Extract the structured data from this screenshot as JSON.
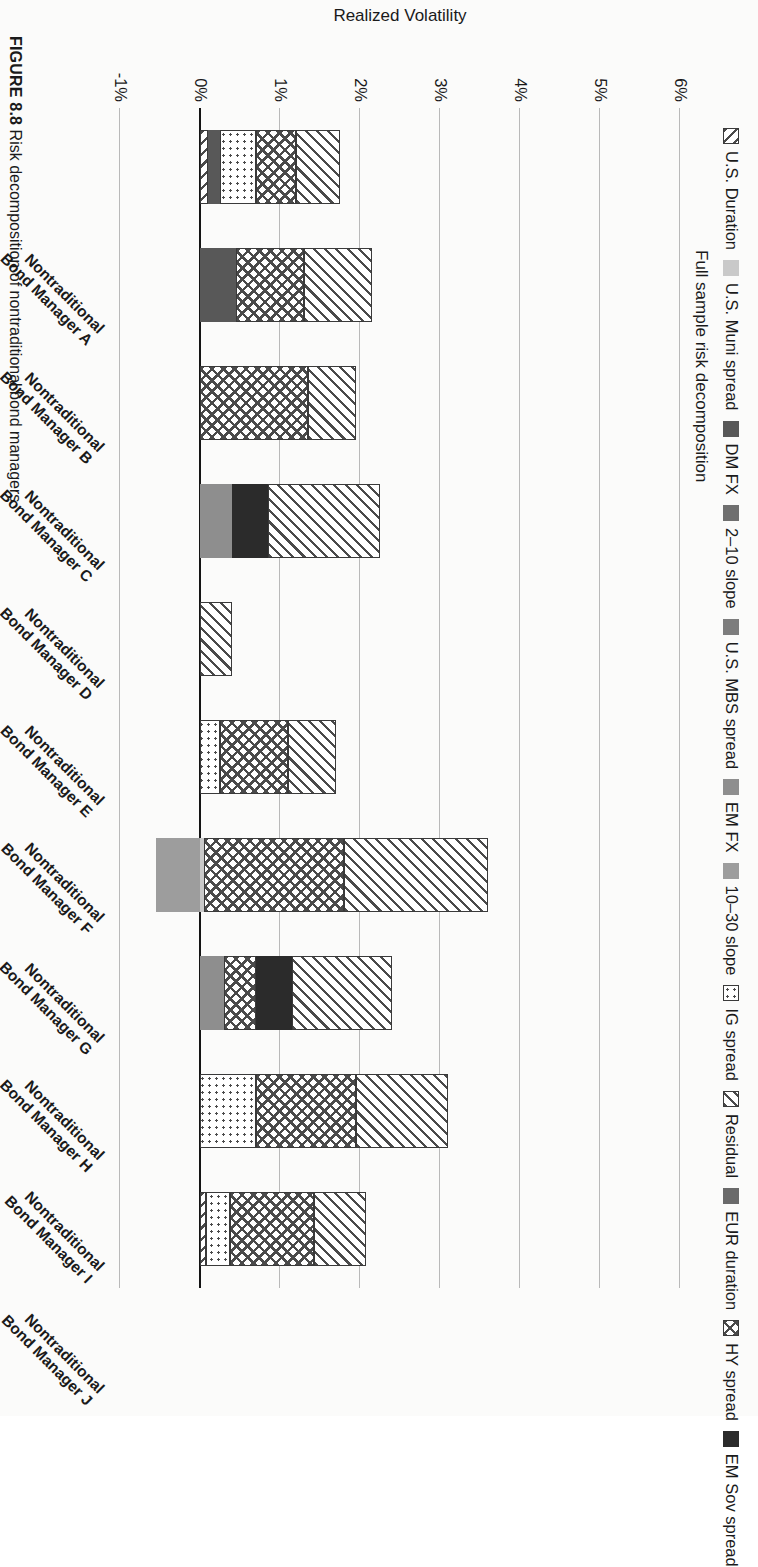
{
  "chart_title": "Full sample risk decomposition",
  "caption": {
    "label": "FIGURE 8.8",
    "text": "Risk decomposition of nontraditional bond managers"
  },
  "axes": {
    "ylabel": "Realized Volatility",
    "yticks": [
      "6%",
      "5%",
      "4%",
      "3%",
      "2%",
      "1%",
      "0%",
      "-1%"
    ],
    "ymin": -1,
    "ymax": 6,
    "gridlines": true
  },
  "legend": {
    "position": "top",
    "columns": 4,
    "rows": 3,
    "items": [
      {
        "label": "U.S. Duration",
        "pattern": "diag-up-thin",
        "color": "#ffffff",
        "icon": "swatch-diag-up"
      },
      {
        "label": "U.S. Muni spread",
        "pattern": "solid",
        "color": "#c9c9c9",
        "icon": "swatch-solid-lightgray"
      },
      {
        "label": "DM FX",
        "pattern": "solid",
        "color": "#585858",
        "icon": "swatch-solid-darkgray"
      },
      {
        "label": "2–10 slope",
        "pattern": "solid",
        "color": "#6f6f6f",
        "icon": "swatch-solid-gray"
      },
      {
        "label": "U.S. MBS spread",
        "pattern": "solid",
        "color": "#7d7d7d",
        "icon": "swatch-solid-gray2"
      },
      {
        "label": "EM FX",
        "pattern": "solid",
        "color": "#8e8e8e",
        "icon": "swatch-solid-midgray"
      },
      {
        "label": "10–30 slope",
        "pattern": "solid",
        "color": "#9d9d9d",
        "icon": "swatch-solid-gray3"
      },
      {
        "label": "IG spread",
        "pattern": "dots",
        "color": "#ffffff",
        "icon": "swatch-dotted"
      },
      {
        "label": "Residual",
        "pattern": "diag-down-thin",
        "color": "#ffffff",
        "icon": "swatch-diag-down"
      },
      {
        "label": "EUR duration",
        "pattern": "solid",
        "color": "#6a6a6a",
        "icon": "swatch-solid-gray4"
      },
      {
        "label": "HY spread",
        "pattern": "crosshatch",
        "color": "#ffffff",
        "icon": "swatch-crosshatch"
      },
      {
        "label": "EM Sov spread",
        "pattern": "solid",
        "color": "#2b2b2b",
        "icon": "swatch-solid-black"
      }
    ]
  },
  "chart_data": {
    "type": "bar",
    "subtype": "stacked-bar",
    "title": "Full sample risk decomposition",
    "xlabel": "",
    "ylabel": "Realized Volatility",
    "ylim": [
      -1,
      6
    ],
    "yticks": [
      -1,
      0,
      1,
      2,
      3,
      4,
      5,
      6
    ],
    "ytick_labels": [
      "-1%",
      "0%",
      "1%",
      "2%",
      "3%",
      "4%",
      "5%",
      "6%"
    ],
    "grid": true,
    "legend_position": "top",
    "categories": [
      "Nontraditional Bond Manager A",
      "Nontraditional Bond Manager B",
      "Nontraditional Bond Manager C",
      "Nontraditional Bond Manager D",
      "Nontraditional Bond Manager E",
      "Nontraditional Bond Manager F",
      "Nontraditional Bond Manager G",
      "Nontraditional Bond Manager H",
      "Nontraditional Bond Manager I",
      "Nontraditional Bond Manager J"
    ],
    "series": [
      {
        "name": "U.S. Duration",
        "values": [
          0.1,
          0.0,
          0.0,
          0.0,
          0.0,
          0.0,
          0.0,
          0.0,
          0.0,
          0.08
        ]
      },
      {
        "name": "U.S. Muni spread",
        "values": [
          0.0,
          0.0,
          0.0,
          0.0,
          0.0,
          0.0,
          0.05,
          0.0,
          0.0,
          0.0
        ]
      },
      {
        "name": "DM FX",
        "values": [
          0.15,
          0.45,
          0.0,
          0.0,
          0.0,
          0.0,
          0.0,
          0.0,
          0.0,
          0.0
        ]
      },
      {
        "name": "2–10 slope",
        "values": [
          0.0,
          0.0,
          0.0,
          0.0,
          0.0,
          0.0,
          0.0,
          0.0,
          0.0,
          0.0
        ]
      },
      {
        "name": "U.S. MBS spread",
        "values": [
          0.0,
          0.0,
          0.0,
          0.0,
          0.0,
          0.0,
          0.0,
          0.0,
          0.0,
          0.0
        ]
      },
      {
        "name": "EM FX",
        "values": [
          0.0,
          0.0,
          0.0,
          0.4,
          0.0,
          0.0,
          0.0,
          0.3,
          0.0,
          0.0
        ]
      },
      {
        "name": "10–30 slope",
        "values": [
          0.0,
          0.0,
          0.0,
          0.0,
          0.0,
          0.0,
          -0.55,
          0.0,
          0.0,
          0.0
        ]
      },
      {
        "name": "IG spread",
        "values": [
          0.45,
          0.0,
          0.0,
          0.0,
          0.0,
          0.25,
          0.0,
          0.0,
          0.7,
          0.3
        ]
      },
      {
        "name": "EUR duration",
        "values": [
          0.0,
          0.0,
          0.0,
          0.0,
          0.0,
          0.0,
          0.0,
          0.0,
          0.0,
          0.0
        ]
      },
      {
        "name": "HY spread",
        "values": [
          0.5,
          0.85,
          1.35,
          0.0,
          0.0,
          0.85,
          1.75,
          0.4,
          1.25,
          1.05
        ]
      },
      {
        "name": "EM Sov spread",
        "values": [
          0.0,
          0.0,
          0.0,
          0.45,
          0.0,
          0.0,
          0.0,
          0.45,
          0.0,
          0.0
        ]
      },
      {
        "name": "Residual",
        "values": [
          0.55,
          0.85,
          0.6,
          1.4,
          0.4,
          0.6,
          1.8,
          1.25,
          1.15,
          0.65
        ]
      }
    ],
    "totals_positive": [
      1.75,
      2.15,
      1.95,
      2.25,
      0.4,
      1.7,
      3.6,
      2.4,
      3.1,
      2.08
    ],
    "totals_negative": [
      0.0,
      0.0,
      0.0,
      0.0,
      0.0,
      0.0,
      -0.55,
      0.0,
      0.0,
      0.0
    ]
  }
}
